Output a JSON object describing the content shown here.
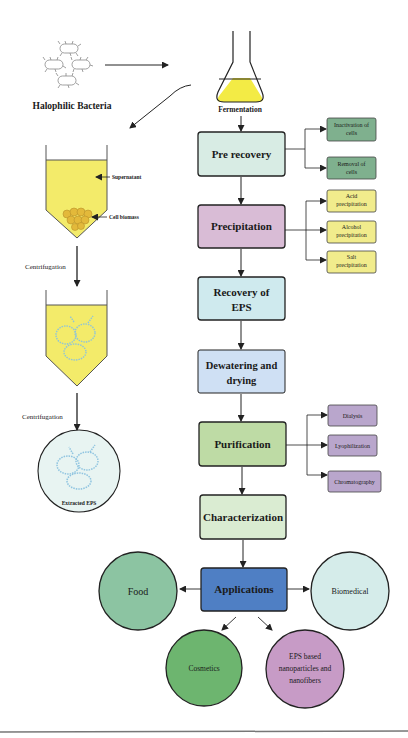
{
  "source": {
    "bacteria_label": "Halophilic Bacteria",
    "flask_label": "Fermentation"
  },
  "left_process": {
    "supernatant_label": "Supernatant",
    "cell_biomass_label": "Cell biomass",
    "centrifugation_1": "Centrifugation",
    "centrifugation_2": "Centrifugation",
    "extracted_label": "Extracted EPS"
  },
  "steps": [
    {
      "line1": "Pre recovery",
      "line2": "",
      "color": "#d8ece4"
    },
    {
      "line1": "Precipitation",
      "line2": "",
      "color": "#d9bcd6"
    },
    {
      "line1": "Recovery of",
      "line2": "EPS",
      "color": "#cfeaee"
    },
    {
      "line1": "Dewatering and",
      "line2": "drying",
      "color": "#cfe0f4"
    },
    {
      "line1": "Purification",
      "line2": "",
      "color": "#bedba5"
    },
    {
      "line1": "Characterization",
      "line2": "",
      "color": "#daecd2"
    },
    {
      "line1": "Applications",
      "line2": "",
      "color": "#4f7fc4"
    }
  ],
  "pre_recovery_sub": [
    {
      "line1": "Inactivation of",
      "line2": "cells"
    },
    {
      "line1": "Removal of",
      "line2": "cells"
    }
  ],
  "precipitation_sub": [
    {
      "line1": "Acid",
      "line2": "precipitation"
    },
    {
      "line1": "Alcohol",
      "line2": "precipitation"
    },
    {
      "line1": "Salt",
      "line2": "precipitation"
    }
  ],
  "purification_sub": [
    {
      "line1": "Dialysis"
    },
    {
      "line1": "Lyophilization"
    },
    {
      "line1": "Chromatography"
    }
  ],
  "applications": {
    "food": "Food",
    "biomedical": "Biomedical",
    "cosmetics": "Cosmetics",
    "nano_line1": "EPS based",
    "nano_line2": "nanoparticles and",
    "nano_line3": "nanofibers"
  },
  "colors": {
    "sub_green": "#7fb08e",
    "sub_yellow": "#f1ec8c",
    "sub_purple": "#b9a6cc",
    "food": "#8cc4a2",
    "biomedical": "#d5ecea",
    "cosmetics": "#6db56f",
    "nano": "#c79bc6",
    "liquid": "#f3eb6a"
  }
}
